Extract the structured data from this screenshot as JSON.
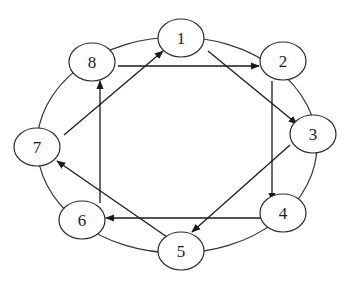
{
  "diagram": {
    "type": "directed-graph-on-ring",
    "nodes": [
      {
        "id": "1",
        "label": "1",
        "cx": 181,
        "cy": 38
      },
      {
        "id": "2",
        "label": "2",
        "cx": 283,
        "cy": 61
      },
      {
        "id": "3",
        "label": "3",
        "cx": 313,
        "cy": 134
      },
      {
        "id": "4",
        "label": "4",
        "cx": 283,
        "cy": 213
      },
      {
        "id": "5",
        "label": "5",
        "cx": 181,
        "cy": 251
      },
      {
        "id": "6",
        "label": "6",
        "cx": 82,
        "cy": 220
      },
      {
        "id": "7",
        "label": "7",
        "cx": 37,
        "cy": 147
      },
      {
        "id": "8",
        "label": "8",
        "cx": 92,
        "cy": 62
      }
    ],
    "ring_edges": [
      "1-2",
      "2-3",
      "3-4",
      "4-5",
      "5-6",
      "6-7",
      "7-8",
      "8-1"
    ],
    "directed_edges": [
      {
        "from": "8",
        "to": "2",
        "x1": 118,
        "y1": 66,
        "x2": 259,
        "y2": 66
      },
      {
        "from": "1",
        "to": "3",
        "x1": 208,
        "y1": 51,
        "x2": 297,
        "y2": 124
      },
      {
        "from": "2",
        "to": "4",
        "x1": 272,
        "y1": 81,
        "x2": 272,
        "y2": 201
      },
      {
        "from": "3",
        "to": "5",
        "x1": 290,
        "y1": 145,
        "x2": 192,
        "y2": 232
      },
      {
        "from": "4",
        "to": "6",
        "x1": 262,
        "y1": 218,
        "x2": 106,
        "y2": 218
      },
      {
        "from": "5",
        "to": "7",
        "x1": 167,
        "y1": 237,
        "x2": 57,
        "y2": 161
      },
      {
        "from": "6",
        "to": "8",
        "x1": 100,
        "y1": 203,
        "x2": 100,
        "y2": 81
      },
      {
        "from": "7",
        "to": "1",
        "x1": 64,
        "y1": 135,
        "x2": 163,
        "y2": 51
      }
    ],
    "colors": {
      "stroke": "#1a1a1a",
      "background": "#ffffff"
    }
  }
}
